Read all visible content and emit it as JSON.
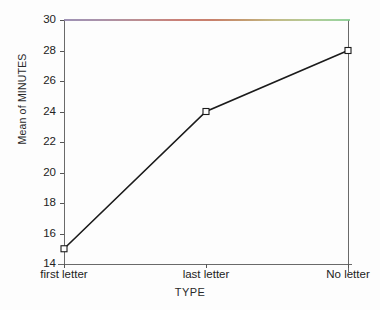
{
  "chart_data": {
    "type": "line",
    "title": "",
    "xlabel": "TYPE",
    "ylabel": "Mean of MINUTES",
    "categories": [
      "first letter",
      "last letter",
      "No letter"
    ],
    "values": [
      15,
      24,
      28
    ],
    "series": [
      {
        "name": "Mean of MINUTES",
        "values": [
          15,
          24,
          28
        ]
      }
    ],
    "ylim": [
      14,
      30
    ],
    "yticks": [
      14,
      16,
      18,
      20,
      22,
      24,
      26,
      28,
      30
    ],
    "ytick_labels": [
      "14",
      "16",
      "18",
      "20",
      "22",
      "24",
      "26",
      "28",
      "30"
    ],
    "grid": false,
    "legend": false,
    "legend_position": "none",
    "marker": "open-square",
    "line_color": "#1b1b1b",
    "marker_color": "#1b1b1b",
    "axis_color": "#6a6a6a",
    "background_color": "#fdfdfd"
  },
  "axes": {
    "y_title": "Mean of MINUTES",
    "x_title": "TYPE"
  }
}
